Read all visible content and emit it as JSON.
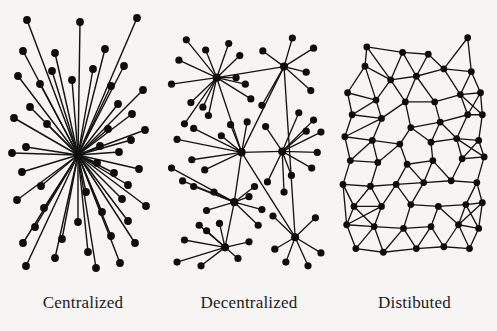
{
  "figure": {
    "background_color": "#f6f5f3",
    "node_color": "#0d0d0d",
    "edge_color": "#141414",
    "width": 497,
    "height": 331
  },
  "panels": [
    {
      "id": "centralized",
      "caption": "Centralized",
      "topology": "star",
      "hub_count": 1,
      "node_count": 41,
      "hubs": [
        [
          78,
          155
        ]
      ],
      "nodes": [
        [
          78,
          155
        ],
        [
          27,
          20
        ],
        [
          80,
          22
        ],
        [
          137,
          18
        ],
        [
          23,
          51
        ],
        [
          55,
          53
        ],
        [
          105,
          49
        ],
        [
          52,
          71
        ],
        [
          93,
          69
        ],
        [
          124,
          66
        ],
        [
          18,
          76
        ],
        [
          40,
          84
        ],
        [
          72,
          80
        ],
        [
          30,
          107
        ],
        [
          111,
          86
        ],
        [
          143,
          90
        ],
        [
          14,
          118
        ],
        [
          47,
          124
        ],
        [
          118,
          104
        ],
        [
          132,
          114
        ],
        [
          145,
          130
        ],
        [
          26,
          147
        ],
        [
          108,
          129
        ],
        [
          131,
          140
        ],
        [
          12,
          153
        ],
        [
          100,
          146
        ],
        [
          119,
          152
        ],
        [
          22,
          172
        ],
        [
          97,
          163
        ],
        [
          139,
          169
        ],
        [
          41,
          186
        ],
        [
          114,
          173
        ],
        [
          128,
          185
        ],
        [
          17,
          200
        ],
        [
          86,
          192
        ],
        [
          122,
          199
        ],
        [
          44,
          208
        ],
        [
          102,
          212
        ],
        [
          146,
          206
        ],
        [
          35,
          227
        ],
        [
          78,
          222
        ],
        [
          128,
          221
        ],
        [
          23,
          243
        ],
        [
          62,
          239
        ],
        [
          111,
          236
        ],
        [
          55,
          258
        ],
        [
          88,
          252
        ],
        [
          135,
          243
        ],
        [
          26,
          266
        ],
        [
          96,
          268
        ],
        [
          120,
          263
        ]
      ],
      "edges_description": "Every peripheral node connects only to the single central hub"
    },
    {
      "id": "decentralized",
      "caption": "Decentralized",
      "topology": "multi-hub star cluster",
      "hub_count": 6,
      "node_count": 46,
      "hubs": [
        [
          55,
          72
        ],
        [
          128,
          60
        ],
        [
          82,
          153
        ],
        [
          126,
          152
        ],
        [
          74,
          207
        ],
        [
          64,
          256
        ],
        [
          140,
          245
        ]
      ],
      "nodes": [
        [
          55,
          72
        ],
        [
          128,
          60
        ],
        [
          82,
          153
        ],
        [
          126,
          152
        ],
        [
          74,
          207
        ],
        [
          64,
          256
        ],
        [
          140,
          245
        ],
        [
          22,
          31
        ],
        [
          68,
          35
        ],
        [
          137,
          29
        ],
        [
          14,
          53
        ],
        [
          43,
          42
        ],
        [
          105,
          43
        ],
        [
          6,
          79
        ],
        [
          80,
          48
        ],
        [
          160,
          40
        ],
        [
          27,
          99
        ],
        [
          76,
          72
        ],
        [
          152,
          66
        ],
        [
          40,
          104
        ],
        [
          86,
          79
        ],
        [
          157,
          86
        ],
        [
          20,
          122
        ],
        [
          92,
          95
        ],
        [
          12,
          139
        ],
        [
          104,
          102
        ],
        [
          30,
          127
        ],
        [
          108,
          125
        ],
        [
          46,
          113
        ],
        [
          144,
          110
        ],
        [
          6,
          170
        ],
        [
          160,
          118
        ],
        [
          28,
          161
        ],
        [
          168,
          131
        ],
        [
          18,
          184
        ],
        [
          152,
          130
        ],
        [
          42,
          172
        ],
        [
          164,
          153
        ],
        [
          60,
          135
        ],
        [
          158,
          170
        ],
        [
          70,
          123
        ],
        [
          136,
          178
        ],
        [
          88,
          120
        ],
        [
          110,
          185
        ],
        [
          96,
          190
        ],
        [
          128,
          196
        ],
        [
          30,
          190
        ],
        [
          52,
          196
        ],
        [
          44,
          216
        ],
        [
          90,
          201
        ],
        [
          36,
          232
        ],
        [
          104,
          215
        ],
        [
          58,
          230
        ],
        [
          100,
          232
        ],
        [
          20,
          248
        ],
        [
          44,
          238
        ],
        [
          12,
          272
        ],
        [
          38,
          276
        ],
        [
          78,
          268
        ],
        [
          90,
          250
        ],
        [
          116,
          222
        ],
        [
          162,
          224
        ],
        [
          118,
          258
        ],
        [
          168,
          262
        ],
        [
          130,
          272
        ],
        [
          154,
          276
        ]
      ],
      "edges_description": "Hubs interconnect with one another; each hub also fans out to its own leaf nodes"
    },
    {
      "id": "distributed",
      "caption": "Distibuted",
      "topology": "mesh lattice",
      "hub_count": 0,
      "node_count": 54,
      "nodes": [
        [
          38,
          38
        ],
        [
          77,
          44
        ],
        [
          105,
          46
        ],
        [
          148,
          28
        ],
        [
          36,
          59
        ],
        [
          64,
          74
        ],
        [
          92,
          70
        ],
        [
          122,
          62
        ],
        [
          152,
          65
        ],
        [
          17,
          88
        ],
        [
          48,
          96
        ],
        [
          80,
          98
        ],
        [
          112,
          98
        ],
        [
          140,
          90
        ],
        [
          162,
          88
        ],
        [
          22,
          112
        ],
        [
          54,
          116
        ],
        [
          86,
          126
        ],
        [
          118,
          120
        ],
        [
          148,
          112
        ],
        [
          164,
          112
        ],
        [
          14,
          136
        ],
        [
          44,
          140
        ],
        [
          74,
          144
        ],
        [
          108,
          142
        ],
        [
          136,
          138
        ],
        [
          160,
          140
        ],
        [
          20,
          162
        ],
        [
          50,
          164
        ],
        [
          82,
          166
        ],
        [
          110,
          162
        ],
        [
          142,
          160
        ],
        [
          166,
          158
        ],
        [
          12,
          188
        ],
        [
          42,
          190
        ],
        [
          70,
          188
        ],
        [
          100,
          186
        ],
        [
          130,
          184
        ],
        [
          158,
          186
        ],
        [
          24,
          212
        ],
        [
          54,
          212
        ],
        [
          86,
          210
        ],
        [
          116,
          212
        ],
        [
          146,
          210
        ],
        [
          164,
          208
        ],
        [
          16,
          232
        ],
        [
          46,
          234
        ],
        [
          78,
          236
        ],
        [
          108,
          234
        ],
        [
          138,
          232
        ],
        [
          160,
          236
        ],
        [
          26,
          258
        ],
        [
          56,
          262
        ],
        [
          92,
          258
        ],
        [
          122,
          256
        ],
        [
          150,
          258
        ]
      ],
      "edges_description": "Each node connects to several nearby neighbours, forming a redundant triangulated mesh with no central hub"
    }
  ]
}
